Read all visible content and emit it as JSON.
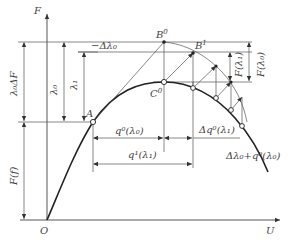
{
  "diagram": {
    "type": "PV continuation curve (continuation power flow predictor-corrector)",
    "axes": {
      "x_label": "U",
      "y_label": "F",
      "origin_label": "O"
    },
    "points": {
      "A": "A",
      "B0": "B",
      "B0_sup": "0",
      "B1": "B",
      "B1_sup": "1",
      "C0": "C",
      "C0_sup": "0"
    },
    "dimension_labels": {
      "lambda0_delta_F": "λ₀ΔF",
      "lambda0": "λ₀",
      "lambda1": "λ₁",
      "minus_delta_lambda0": "−Δλ₀",
      "F_lambda1": "F(λ₁)",
      "F_lambda0": "F(λ₀)",
      "F_f": "F(f)",
      "q0_lambda0": "q⁰(λ₀)",
      "q1_lambda1": "q¹(λ₁)",
      "delta_q0_lambda1": "Δq⁰(λ₁)",
      "delta_lambda0_plus_q0": "Δλ₀+q⁰(λ₀)"
    }
  }
}
